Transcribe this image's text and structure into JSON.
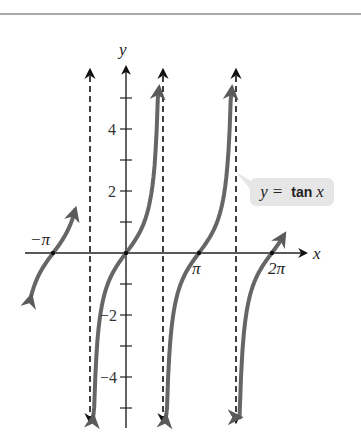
{
  "chart_data": {
    "type": "line",
    "title": "",
    "function": "y = tan x",
    "xlabel": "x",
    "ylabel": "y",
    "x_tick_labels": [
      "-π",
      "π",
      "2π"
    ],
    "x_tick_values": [
      -3.14159,
      3.14159,
      6.28319
    ],
    "y_tick_labels": [
      "-4",
      "-2",
      "2",
      "4"
    ],
    "y_tick_values": [
      -4,
      -2,
      2,
      4
    ],
    "y_ticks_unlabeled": [
      -5,
      -3,
      -1,
      1,
      3,
      5
    ],
    "xlim": [
      -4.3,
      7.7
    ],
    "ylim": [
      -5.5,
      5.8
    ],
    "asymptotes": [
      -1.5708,
      1.5708,
      4.7124
    ],
    "asymptote_style": "dashed",
    "branches": [
      {
        "x_start": -4.1,
        "x_end": -2.2,
        "note": "branch through -π, arrow at lower-left"
      },
      {
        "x_start": -1.42,
        "x_end": 1.42,
        "note": "branch through origin"
      },
      {
        "x_start": 1.72,
        "x_end": 4.56,
        "note": "branch through π"
      },
      {
        "x_start": 4.86,
        "x_end": 6.8,
        "note": "branch through 2π, arrow at upper-right"
      }
    ],
    "zeros": [
      -3.14159,
      0,
      3.14159,
      6.28319
    ],
    "annotations": [
      "y = tan x"
    ],
    "grid": false,
    "curve_color": "#666666",
    "axis_color": "#222222"
  },
  "labels": {
    "x_axis": "x",
    "y_axis": "y",
    "neg_pi": "−π",
    "pi": "π",
    "two_pi": "2π",
    "y4": "4",
    "y2": "2",
    "yn2": "−2",
    "yn4": "−4"
  },
  "callout": {
    "y": "y",
    "eq": "=",
    "fn": "tan",
    "x": "x"
  }
}
